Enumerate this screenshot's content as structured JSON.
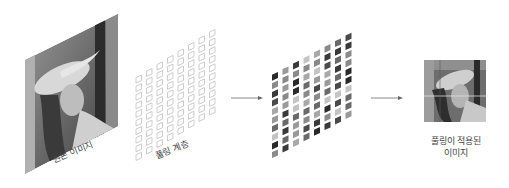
{
  "diagram": {
    "stages": [
      {
        "id": "original",
        "label": "원본 이미지"
      },
      {
        "id": "pooling_layer",
        "label": "풀링 계층",
        "grid": {
          "cols": 8,
          "rows": 10
        }
      },
      {
        "id": "pooled_tiles",
        "grid": {
          "cols": 8,
          "rows": 10
        }
      },
      {
        "id": "result",
        "label_line1": "풀링이 적용된",
        "label_line2": "이미지"
      }
    ],
    "arrows": [
      {
        "from": "pooling_layer",
        "to": "pooled_tiles"
      },
      {
        "from": "pooled_tiles",
        "to": "result"
      }
    ],
    "colors": {
      "background": "#ffffff",
      "grid_outline": "#b8b8b8",
      "arrow": "#777777",
      "text": "#444444"
    }
  }
}
